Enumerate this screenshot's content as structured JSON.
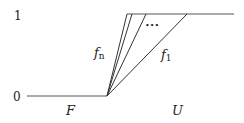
{
  "diagram": {
    "y_labels": {
      "one": "1",
      "zero": "0"
    },
    "region_labels": {
      "left": "F",
      "right": "U"
    },
    "curve_labels": {
      "fn": {
        "base": "f",
        "sub": "n"
      },
      "f1": {
        "base": "f",
        "sub": "1"
      }
    },
    "ellipsis": "•••",
    "line_color": "#333333"
  }
}
